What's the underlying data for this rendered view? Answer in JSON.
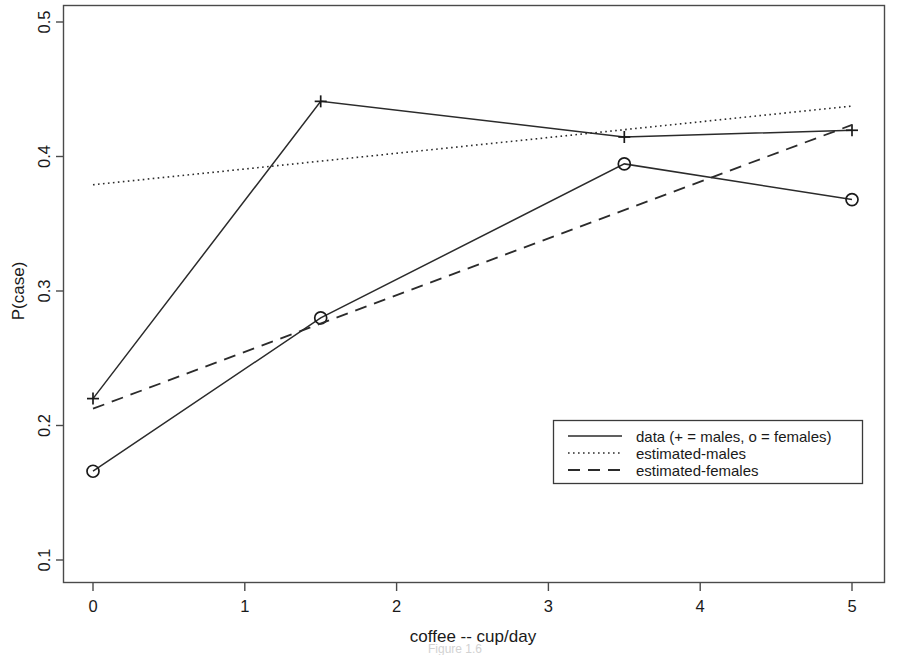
{
  "chart_data": {
    "type": "line",
    "title": "",
    "xlabel": "coffee -- cup/day",
    "ylabel": "P(case)",
    "xlim": [
      -0.2,
      5.2
    ],
    "ylim": [
      0.092,
      0.508
    ],
    "xticks": [
      "0",
      "1",
      "2",
      "3",
      "4",
      "5"
    ],
    "xtick_values": [
      0,
      1,
      2,
      3,
      4,
      5
    ],
    "yticks": [
      "0.1",
      "0.2",
      "0.3",
      "0.4",
      "0.5"
    ],
    "ytick_values": [
      0.1,
      0.2,
      0.3,
      0.4,
      0.5
    ],
    "grid": false,
    "legend_position": "lower right inside",
    "series": [
      {
        "name": "data (+ = males, o = females)",
        "style": "solid",
        "marker": "+",
        "subgroup": "males",
        "x": [
          0,
          1.5,
          3.5,
          5
        ],
        "values": [
          0.22,
          0.441,
          0.4145,
          0.4195
        ]
      },
      {
        "name": "data (+ = males, o = females)",
        "style": "solid",
        "marker": "o",
        "subgroup": "females",
        "x": [
          0,
          1.5,
          3.5,
          5
        ],
        "values": [
          0.166,
          0.28,
          0.3945,
          0.368
        ]
      },
      {
        "name": "estimated-males",
        "style": "dotted",
        "marker": "none",
        "x": [
          0,
          5
        ],
        "values": [
          0.379,
          0.4375
        ]
      },
      {
        "name": "estimated-females",
        "style": "dashed",
        "marker": "none",
        "x": [
          0,
          5
        ],
        "values": [
          0.2125,
          0.4235
        ]
      }
    ],
    "legend_entries": [
      {
        "label": "data (+ = males, o = females)",
        "style": "solid"
      },
      {
        "label": "estimated-males",
        "style": "dotted"
      },
      {
        "label": "estimated-females",
        "style": "dashed"
      }
    ],
    "colors": {
      "line": "#2b2b2b",
      "axis": "#4a4a4a",
      "text": "#1a1a1a",
      "background": "#ffffff"
    }
  },
  "axis": {
    "xlabel": "coffee -- cup/day",
    "ylabel": "P(case)",
    "xticks": [
      "0",
      "1",
      "2",
      "3",
      "4",
      "5"
    ],
    "yticks": [
      "0.1",
      "0.2",
      "0.3",
      "0.4",
      "0.5"
    ]
  },
  "legend": {
    "items": [
      {
        "label": "data (+ = males, o = females)"
      },
      {
        "label": "estimated-males"
      },
      {
        "label": "estimated-females"
      }
    ]
  },
  "caption": {
    "text": "Figure 1.6"
  }
}
